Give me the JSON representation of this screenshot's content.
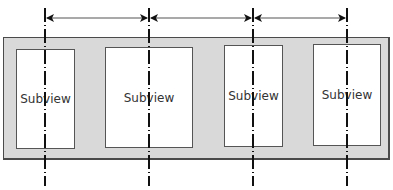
{
  "diagram": {
    "container": {
      "fill": "#d9d9d9",
      "border": "#4a4a4a"
    },
    "subviews": [
      {
        "label": "Subview",
        "x": 16,
        "y": 49,
        "w": 59,
        "h": 100
      },
      {
        "label": "Subview",
        "x": 105,
        "y": 47,
        "w": 88,
        "h": 101
      },
      {
        "label": "Subview",
        "x": 224,
        "y": 45,
        "w": 59,
        "h": 102
      },
      {
        "label": "Subview",
        "x": 313,
        "y": 44,
        "w": 68,
        "h": 102
      }
    ],
    "center_lines_x": [
      45,
      149,
      253,
      347
    ],
    "center_line_style": "dashed",
    "arrows": [
      {
        "from_x": 45,
        "to_x": 149,
        "y": 18,
        "type": "double-headed"
      },
      {
        "from_x": 149,
        "to_x": 253,
        "y": 18,
        "type": "double-headed"
      },
      {
        "from_x": 253,
        "to_x": 347,
        "y": 18,
        "type": "double-headed"
      }
    ],
    "colors": {
      "line": "#111111",
      "arrow": "#555555",
      "subview_fill": "#ffffff",
      "subview_border": "#555555",
      "text": "#333333"
    }
  }
}
